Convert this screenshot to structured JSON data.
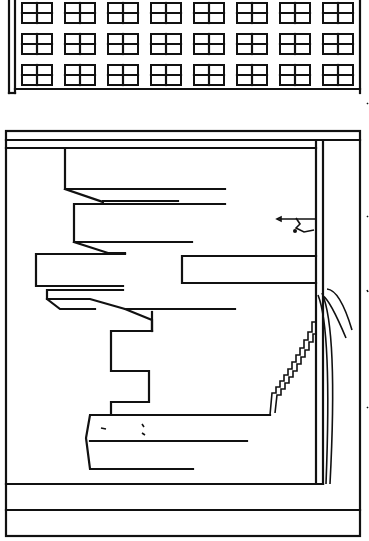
{
  "scene": {
    "description": "Rotated line-art comic panels: building facade with window grid above, cityscape with staircase and small climbing figure below",
    "colors": {
      "ink": "#111111",
      "paper": "#ffffff"
    }
  },
  "facade": {
    "rows": 3,
    "cols": 8,
    "window_origin": [
      22,
      3
    ],
    "window_size": [
      30,
      20
    ],
    "col_step": 43,
    "row_step": 31
  },
  "figure": {
    "label": "climbing-person",
    "position": [
      298,
      222
    ]
  }
}
